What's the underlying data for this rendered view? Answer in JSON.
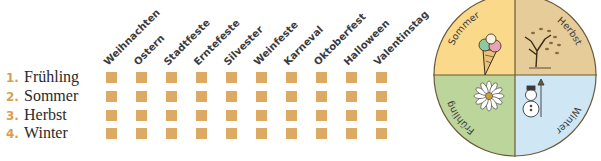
{
  "header_columns": [
    {
      "label": "Weihnachten"
    },
    {
      "label": "Ostern"
    },
    {
      "label": "Stadtfeste"
    },
    {
      "label": "Erntefeste"
    },
    {
      "label": "Silvester"
    },
    {
      "label": "Weinfeste"
    },
    {
      "label": "Karneval"
    },
    {
      "label": "Oktoberfest"
    },
    {
      "label": "Halloween"
    },
    {
      "label": "Valentinstag"
    }
  ],
  "rows": [
    {
      "number": "1.",
      "label": "Frühling"
    },
    {
      "number": "2.",
      "label": "Sommer"
    },
    {
      "number": "3.",
      "label": "Herbst"
    },
    {
      "number": "4.",
      "label": "Winter"
    }
  ],
  "wheel": {
    "quadrants": [
      {
        "label": "Sommer",
        "color": "#fbd98a",
        "icon": "ice-cream-icon"
      },
      {
        "label": "Herbst",
        "color": "#e6cc98",
        "icon": "tree-icon"
      },
      {
        "label": "Frühling",
        "color": "#bcd59a",
        "icon": "daisy-icon"
      },
      {
        "label": "Winter",
        "color": "#cfe6f4",
        "icon": "snowman-icon"
      }
    ]
  },
  "colors": {
    "checkbox": "#dcaa62",
    "number": "#d9a04e"
  }
}
